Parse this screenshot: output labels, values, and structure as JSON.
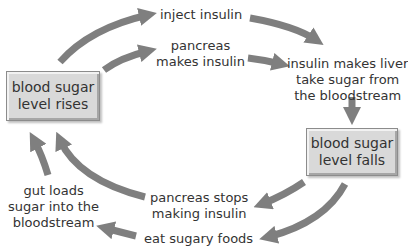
{
  "diagram": {
    "type": "cycle",
    "colors": {
      "arrow": "#7f7f7f",
      "box_fill": "#d9d9d9",
      "box_border": "#8c8c8c",
      "text": "#333333"
    },
    "boxes": {
      "rises": {
        "line1": "blood sugar",
        "line2": "level rises"
      },
      "falls": {
        "line1": "blood sugar",
        "line2": "level falls"
      }
    },
    "labels": {
      "inject": {
        "line1": "inject insulin"
      },
      "pancreas_makes": {
        "line1": "pancreas",
        "line2": "makes insulin"
      },
      "liver": {
        "line1": "insulin makes liver",
        "line2": "take sugar from",
        "line3": "the bloodstream"
      },
      "pancreas_stops": {
        "line1": "pancreas stops",
        "line2": "making insulin"
      },
      "gut": {
        "line1": "gut loads",
        "line2": "sugar into the",
        "line3": "bloodstream"
      },
      "eat": {
        "line1": "eat sugary foods"
      }
    }
  }
}
